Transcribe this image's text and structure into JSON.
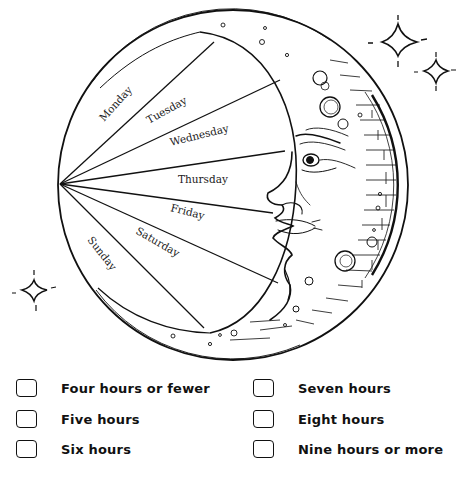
{
  "worksheet": {
    "title_fragment": "",
    "chart": {
      "type": "radial-crescent-diagram",
      "days": [
        {
          "label": "Monday"
        },
        {
          "label": "Tuesday"
        },
        {
          "label": "Wednesday"
        },
        {
          "label": "Thursday"
        },
        {
          "label": "Friday"
        },
        {
          "label": "Saturday"
        },
        {
          "label": "Sunday"
        }
      ]
    },
    "options": {
      "left": [
        {
          "label": "Four hours or fewer",
          "checked": false
        },
        {
          "label": "Five hours",
          "checked": false
        },
        {
          "label": "Six hours",
          "checked": false
        }
      ],
      "right": [
        {
          "label": "Seven hours",
          "checked": false
        },
        {
          "label": "Eight hours",
          "checked": false
        },
        {
          "label": "Nine hours or more",
          "checked": false
        }
      ]
    },
    "icons": [
      "sparkle-star-icon",
      "sparkle-star-icon",
      "sparkle-star-icon",
      "crescent-moon-face-icon"
    ],
    "colors": {
      "ink": "#111111",
      "paper": "#ffffff"
    }
  }
}
